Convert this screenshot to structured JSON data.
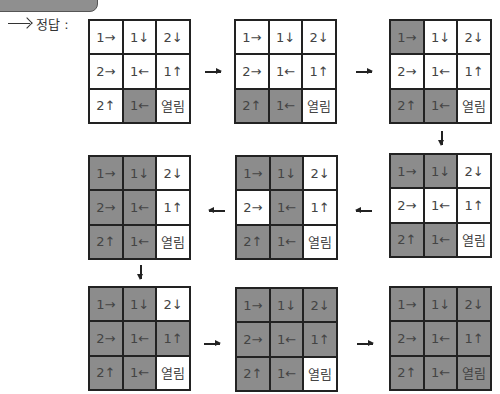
{
  "label": {
    "text": "정답 :"
  },
  "cell_labels": [
    "1→",
    "1↓",
    "2↓",
    "2→",
    "1←",
    "1↑",
    "2↑",
    "1←",
    "열림"
  ],
  "colors": {
    "shaded": "#8c8c8c",
    "open": "#ffffff",
    "border": "#222222"
  },
  "steps": [
    {
      "id": 1,
      "shaded": [
        7
      ]
    },
    {
      "id": 2,
      "shaded": [
        6,
        7
      ]
    },
    {
      "id": 3,
      "shaded": [
        0,
        6,
        7
      ]
    },
    {
      "id": 4,
      "shaded": [
        0,
        1,
        6,
        7
      ]
    },
    {
      "id": 5,
      "shaded": [
        0,
        1,
        4,
        6,
        7
      ]
    },
    {
      "id": 6,
      "shaded": [
        0,
        1,
        3,
        4,
        6,
        7
      ]
    },
    {
      "id": 7,
      "shaded": [
        0,
        1,
        3,
        4,
        5,
        6,
        7
      ]
    },
    {
      "id": 8,
      "shaded": [
        0,
        1,
        2,
        3,
        4,
        5,
        6,
        7
      ]
    },
    {
      "id": 9,
      "shaded": [
        0,
        1,
        2,
        3,
        4,
        5,
        6,
        7,
        8
      ]
    }
  ],
  "arrows": [
    {
      "from": 1,
      "to": 2,
      "dir": "right"
    },
    {
      "from": 2,
      "to": 3,
      "dir": "right"
    },
    {
      "from": 3,
      "to": 4,
      "dir": "down"
    },
    {
      "from": 4,
      "to": 5,
      "dir": "left"
    },
    {
      "from": 5,
      "to": 6,
      "dir": "left"
    },
    {
      "from": 6,
      "to": 7,
      "dir": "down"
    },
    {
      "from": 7,
      "to": 8,
      "dir": "right"
    },
    {
      "from": 8,
      "to": 9,
      "dir": "right"
    }
  ]
}
